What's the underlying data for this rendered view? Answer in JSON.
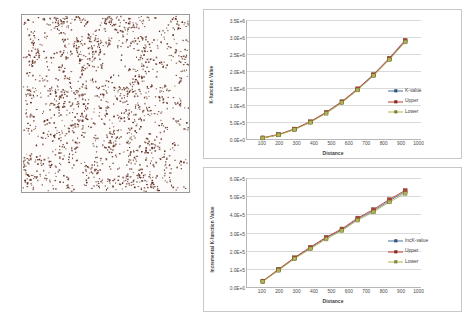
{
  "figure": {
    "panels": [
      "point-pattern-map",
      "k-function-chart",
      "incremental-k-function-chart"
    ]
  },
  "point_pattern": {
    "label": "point-pattern-map",
    "dot_color": "#5c2a1e",
    "background": "#fdfcfa",
    "border_color": "#9a9a9a",
    "point_count": 1600
  },
  "colors": {
    "k_value": "#4472a8",
    "upper": "#c0392b",
    "lower": "#b3b34d",
    "gridline": "#d9d9d9",
    "axis": "#b7b7b7",
    "text": "#4a4a4a"
  },
  "chart_data": [
    {
      "id": "k-function",
      "type": "line",
      "title": "",
      "xlabel": "Distance",
      "ylabel": "K-function Value",
      "x": [
        100,
        200,
        300,
        400,
        500,
        600,
        700,
        800,
        900,
        1000
      ],
      "xticklabels": [
        "100",
        "200",
        "300",
        "400",
        "500",
        "600",
        "700",
        "800",
        "900",
        "1000"
      ],
      "xlim": [
        0,
        1100
      ],
      "ylim": [
        0,
        3500000
      ],
      "yticks": [
        0,
        500000,
        1000000,
        1500000,
        2000000,
        2500000,
        3000000,
        3500000
      ],
      "yticklabels": [
        "0.0E+0",
        "5.0E+5",
        "1.0E+6",
        "1.5E+6",
        "2.0E+6",
        "2.5E+6",
        "3.0E+6",
        "3.5E+6"
      ],
      "grid": true,
      "legend_position": "right",
      "series": [
        {
          "name": "K-value",
          "color": "#4472a8",
          "values": [
            31000,
            126000,
            285000,
            500000,
            770000,
            1085000,
            1460000,
            1880000,
            2355000,
            2880000
          ]
        },
        {
          "name": "Upper",
          "color": "#c0392b",
          "values": [
            36000,
            134000,
            296000,
            513000,
            786000,
            1103000,
            1480000,
            1902000,
            2380000,
            2908000
          ]
        },
        {
          "name": "Lower",
          "color": "#b3b34d",
          "values": [
            27000,
            119000,
            275000,
            488000,
            755000,
            1068000,
            1441000,
            1859000,
            2331000,
            2853000
          ]
        }
      ]
    },
    {
      "id": "incremental-k-function",
      "type": "line",
      "title": "",
      "xlabel": "Distance",
      "ylabel": "Incremental K-function Value",
      "x": [
        100,
        200,
        300,
        400,
        500,
        600,
        700,
        800,
        900,
        1000
      ],
      "xticklabels": [
        "100",
        "200",
        "300",
        "400",
        "500",
        "600",
        "700",
        "800",
        "900",
        "1000"
      ],
      "xlim": [
        0,
        1100
      ],
      "ylim": [
        0,
        600000
      ],
      "yticks": [
        0,
        100000,
        200000,
        300000,
        400000,
        500000,
        600000
      ],
      "yticklabels": [
        "0.0E+0",
        "1.0E+5",
        "2.0E+5",
        "3.0E+5",
        "4.0E+5",
        "5.0E+5",
        "6.0E+5"
      ],
      "grid": true,
      "legend_position": "right",
      "series": [
        {
          "name": "IncK-value",
          "color": "#4472a8",
          "values": [
            31000,
            95000,
            159000,
            215000,
            270000,
            315000,
            375000,
            420000,
            475000,
            525000
          ]
        },
        {
          "name": "Upper",
          "color": "#c0392b",
          "values": [
            33000,
            98000,
            162000,
            219000,
            274000,
            320000,
            380000,
            427000,
            482000,
            532000
          ]
        },
        {
          "name": "Lower",
          "color": "#b3b34d",
          "values": [
            29000,
            92000,
            155000,
            210000,
            264000,
            310000,
            368000,
            413000,
            468000,
            515000
          ]
        }
      ]
    }
  ]
}
